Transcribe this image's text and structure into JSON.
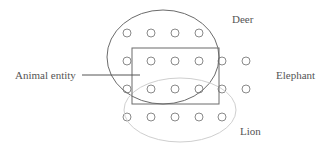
{
  "diagram": {
    "labels": {
      "deer": "Deer",
      "elephant": "Elephant",
      "lion": "Lion",
      "animal_entity": "Animal entity"
    },
    "colors": {
      "deer_ellipse": "#6b6b6b",
      "lion_ellipse": "#cfcfcf",
      "rectangle": "#6b6b6b",
      "dots": "#8a8a8a",
      "text": "#555555"
    },
    "grid": {
      "columns_x": [
        127,
        151,
        175,
        199,
        222,
        246
      ],
      "rows_y": [
        33,
        61,
        89,
        117
      ],
      "row_counts": [
        4,
        6,
        6,
        5
      ],
      "dot_radius": 4
    }
  }
}
